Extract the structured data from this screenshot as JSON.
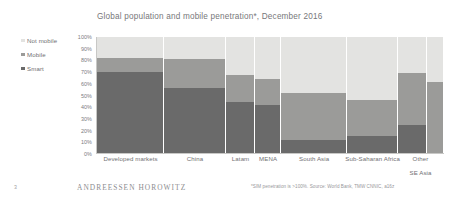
{
  "slide": {
    "page_number": "3",
    "brand": "ANDREESSEN HOROWITZ",
    "source_note": "*SIM penetration is >100%. Source: World Bank, TMW CNNIC, a16z"
  },
  "legend": {
    "items": [
      {
        "label": "Not mobile",
        "color": "#e3e3e1",
        "key": "not_mobile"
      },
      {
        "label": "Mobile",
        "color": "#9b9b99",
        "key": "mobile"
      },
      {
        "label": "Smart",
        "color": "#6a6a6a",
        "key": "smart"
      }
    ]
  },
  "chart_data": {
    "type": "bar",
    "title": "Global population and mobile penetration*, December 2016",
    "xlabel": "",
    "ylabel": "",
    "ylim": [
      0,
      100
    ],
    "grid": false,
    "legend_position": "left",
    "stacked": true,
    "stack_total_percent": 100,
    "variable_width": true,
    "categories": [
      "Developed markets",
      "China",
      "Latam",
      "MENA",
      "South Asia",
      "Sub-Saharan Africa",
      "Other",
      "SE Asia"
    ],
    "category_labels": [
      {
        "text": "Developed markets",
        "line2": ""
      },
      {
        "text": "China",
        "line2": ""
      },
      {
        "text": "Latam",
        "line2": ""
      },
      {
        "text": "MENA",
        "line2": ""
      },
      {
        "text": "South Asia",
        "line2": ""
      },
      {
        "text": "Sub-Saharan Africa",
        "line2": ""
      },
      {
        "text": "Other",
        "line2": "SE Asia"
      }
    ],
    "tick_labels": [
      "100%",
      "90%",
      "80%",
      "70%",
      "60%",
      "50%",
      "40%",
      "30%",
      "20%",
      "10%",
      "0%"
    ],
    "tick_values": [
      100,
      90,
      80,
      70,
      60,
      50,
      40,
      30,
      20,
      10,
      0
    ],
    "series": [
      {
        "name": "Smart",
        "values": [
          70,
          56,
          44,
          41,
          11,
          15,
          24,
          0
        ]
      },
      {
        "name": "Mobile",
        "values": [
          12,
          25,
          23,
          23,
          41,
          31,
          45,
          61
        ]
      },
      {
        "name": "Not mobile",
        "values": [
          18,
          19,
          33,
          36,
          48,
          54,
          31,
          39
        ]
      }
    ],
    "cumulative_tops": {
      "smart": [
        70,
        56,
        44,
        41,
        11,
        15,
        24,
        0
      ],
      "mobile": [
        82,
        81,
        67,
        64,
        52,
        46,
        69,
        61
      ]
    },
    "bar_widths_percent": [
      19.4,
      17.9,
      8.4,
      7.5,
      19.1,
      14.7,
      8.4,
      4.6
    ]
  }
}
